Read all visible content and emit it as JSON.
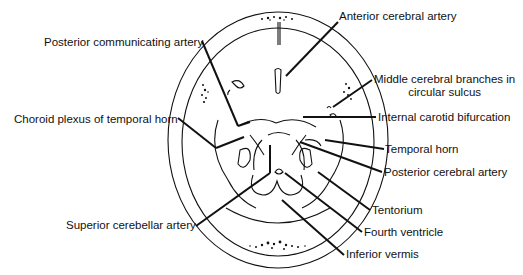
{
  "diagram": {
    "type": "anatomical-line-drawing",
    "labels": [
      {
        "id": "anterior-cerebral-artery",
        "text": "Anterior cerebral artery",
        "x": 339,
        "y": 16
      },
      {
        "id": "posterior-communicating-artery",
        "text": "Posterior communicating artery",
        "x": 44,
        "y": 36
      },
      {
        "id": "middle-cerebral-branches",
        "text": "Middle cerebral branches in",
        "text2": "circular sulcus",
        "x": 374,
        "y": 73
      },
      {
        "id": "internal-carotid-bifurcation",
        "text": "Internal carotid bifurcation",
        "x": 378,
        "y": 112
      },
      {
        "id": "choroid-plexus-temporal-horn",
        "text": "Choroid plexus of temporal horn",
        "x": 14,
        "y": 114
      },
      {
        "id": "temporal-horn",
        "text": "Temporal horn",
        "x": 385,
        "y": 144
      },
      {
        "id": "posterior-cerebral-artery",
        "text": "Posterior cerebral artery",
        "x": 384,
        "y": 168
      },
      {
        "id": "tentorium",
        "text": "Tentorium",
        "x": 372,
        "y": 206
      },
      {
        "id": "superior-cerebellar-artery",
        "text": "Superior cerebellar artery",
        "x": 66,
        "y": 220
      },
      {
        "id": "fourth-ventricle",
        "text": "Fourth ventricle",
        "x": 364,
        "y": 228
      },
      {
        "id": "inferior-vermis",
        "text": "Inferior vermis",
        "x": 346,
        "y": 250
      }
    ]
  }
}
